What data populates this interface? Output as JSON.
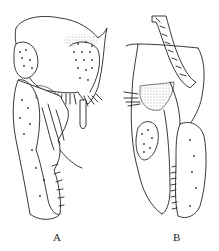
{
  "figure": {
    "panels": [
      {
        "id": "A",
        "label": "A",
        "description": "lateral view, genital appendages with setose plates"
      },
      {
        "id": "B",
        "label": "B",
        "description": "side view, elongated clasper with striated stalk"
      }
    ]
  }
}
